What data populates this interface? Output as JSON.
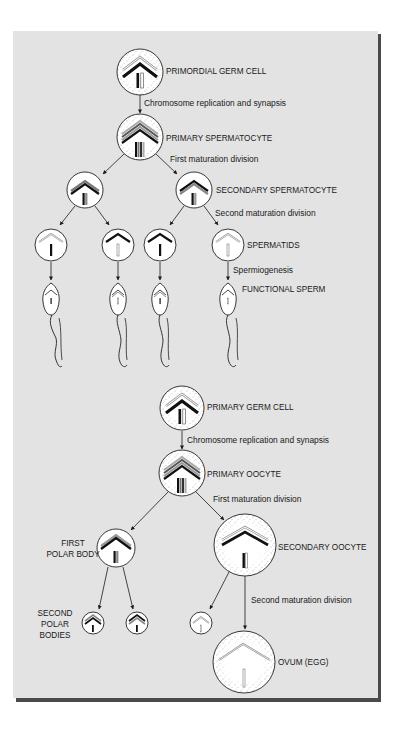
{
  "diagram": {
    "colors": {
      "panel_bg": "#e3e3e3",
      "panel_shadow": "#4a4a4a",
      "cell_fill": "#ffffff",
      "ink": "#1a1a1a"
    },
    "spermatogenesis": {
      "primordial_germ_cell": "PRIMORDIAL GERM CELL",
      "step_replication": "Chromosome replication and synapsis",
      "primary_spermatocyte": "PRIMARY SPERMATOCYTE",
      "step_first_division": "First maturation division",
      "secondary_spermatocyte": "SECONDARY SPERMATOCYTE",
      "step_second_division": "Second maturation division",
      "spermatids": "SPERMATIDS",
      "step_spermiogenesis": "Spermiogenesis",
      "functional_sperm": "FUNCTIONAL SPERM"
    },
    "oogenesis": {
      "primary_germ_cell": "PRIMARY GERM CELL",
      "step_replication": "Chromosome replication and synapsis",
      "primary_oocyte": "PRIMARY OOCYTE",
      "step_first_division": "First maturation division",
      "first_polar_body_line1": "FIRST",
      "first_polar_body_line2": "POLAR BODY",
      "secondary_oocyte": "SECONDARY OOCYTE",
      "step_second_division": "Second maturation division",
      "second_polar_bodies_line1": "SECOND",
      "second_polar_bodies_line2": "POLAR",
      "second_polar_bodies_line3": "BODIES",
      "ovum": "OVUM (EGG)"
    }
  }
}
